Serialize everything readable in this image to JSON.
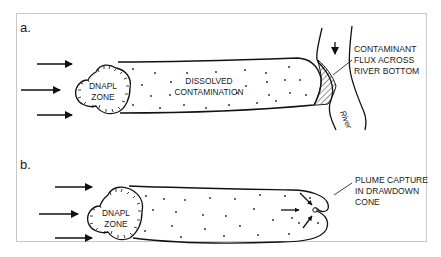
{
  "figure": {
    "panels": [
      {
        "label": "a.",
        "source_zone": {
          "line1": "DNAPL",
          "line2": "ZONE"
        },
        "plume_label": {
          "line1": "DISSOLVED",
          "line2": "CONTAMINATION"
        },
        "callout": {
          "line1": "CONTAMINANT",
          "line2": "FLUX ACROSS",
          "line3": "RIVER BOTTOM"
        },
        "river_label": "River",
        "flow_arrows": 3
      },
      {
        "label": "b.",
        "source_zone": {
          "line1": "DNAPL",
          "line2": "ZONE"
        },
        "callout": {
          "line1": "PLUME CAPTURE",
          "line2": "IN DRAWDOWN",
          "line3": "CONE"
        },
        "flow_arrows": 3
      }
    ],
    "colors": {
      "ink": "#111111",
      "frame": "#c8c8c8",
      "background": "#ffffff"
    }
  }
}
